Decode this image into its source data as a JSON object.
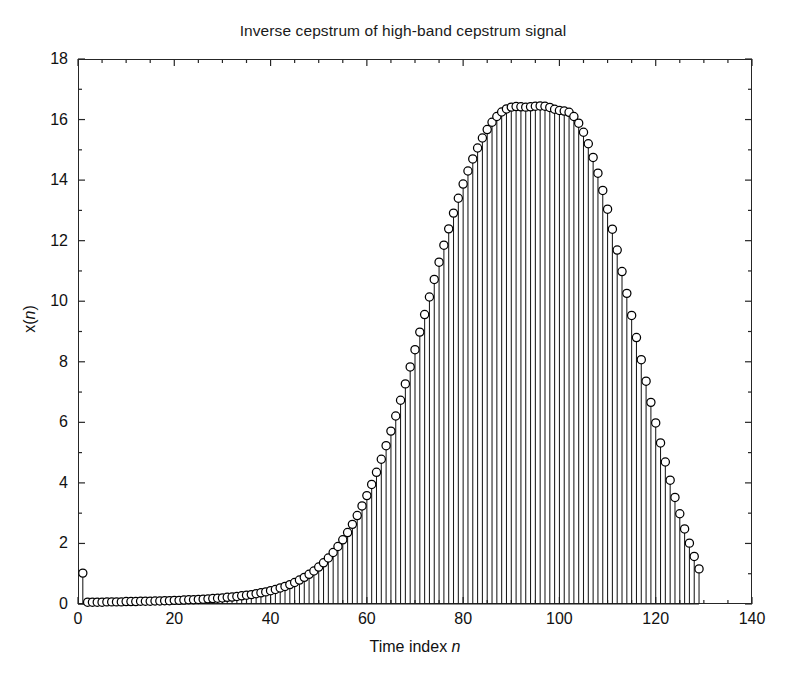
{
  "chart_data": {
    "type": "stem",
    "title": "Inverse cepstrum of high-band cepstrum signal",
    "xlabel_prefix": "Time index ",
    "xlabel_var": "n",
    "ylabel_prefix": "x(",
    "ylabel_var": "n",
    "ylabel_suffix": ")",
    "xlim": [
      0,
      140
    ],
    "ylim": [
      0,
      18
    ],
    "xticks": [
      0,
      20,
      40,
      60,
      80,
      100,
      120,
      140
    ],
    "xtick_labels": [
      "0",
      "20",
      "40",
      "60",
      "80",
      "100",
      "120",
      "140"
    ],
    "yticks": [
      0,
      2,
      4,
      6,
      8,
      10,
      12,
      14,
      16,
      18
    ],
    "ytick_labels": [
      "0",
      "2",
      "4",
      "6",
      "8",
      "10",
      "12",
      "14",
      "16",
      "18"
    ],
    "grid": false,
    "legend": null,
    "marker": "open-circle",
    "marker_color": "#000000",
    "marker_fill": "#ffffff",
    "line_color": "#1a1a1a",
    "background": "#ffffff",
    "peak_x": 100,
    "peak_y": 16.4,
    "data_end_x": 129,
    "x": [
      1,
      2,
      3,
      4,
      5,
      6,
      7,
      8,
      9,
      10,
      11,
      12,
      13,
      14,
      15,
      16,
      17,
      18,
      19,
      20,
      21,
      22,
      23,
      24,
      25,
      26,
      27,
      28,
      29,
      30,
      31,
      32,
      33,
      34,
      35,
      36,
      37,
      38,
      39,
      40,
      41,
      42,
      43,
      44,
      45,
      46,
      47,
      48,
      49,
      50,
      51,
      52,
      53,
      54,
      55,
      56,
      57,
      58,
      59,
      60,
      61,
      62,
      63,
      64,
      65,
      66,
      67,
      68,
      69,
      70,
      71,
      72,
      73,
      74,
      75,
      76,
      77,
      78,
      79,
      80,
      81,
      82,
      83,
      84,
      85,
      86,
      87,
      88,
      89,
      90,
      91,
      92,
      93,
      94,
      95,
      96,
      97,
      98,
      99,
      100,
      101,
      102,
      103,
      104,
      105,
      106,
      107,
      108,
      109,
      110,
      111,
      112,
      113,
      114,
      115,
      116,
      117,
      118,
      119,
      120,
      121,
      122,
      123,
      124,
      125,
      126,
      127,
      128,
      129
    ],
    "y": [
      1.02,
      0.06,
      0.06,
      0.06,
      0.06,
      0.07,
      0.07,
      0.07,
      0.07,
      0.08,
      0.08,
      0.08,
      0.09,
      0.09,
      0.09,
      0.1,
      0.1,
      0.11,
      0.11,
      0.12,
      0.12,
      0.13,
      0.14,
      0.14,
      0.15,
      0.16,
      0.17,
      0.18,
      0.19,
      0.2,
      0.22,
      0.23,
      0.25,
      0.27,
      0.29,
      0.31,
      0.34,
      0.37,
      0.4,
      0.44,
      0.48,
      0.53,
      0.58,
      0.64,
      0.71,
      0.79,
      0.88,
      0.98,
      1.09,
      1.22,
      1.36,
      1.52,
      1.7,
      1.9,
      2.12,
      2.36,
      2.63,
      2.92,
      3.24,
      3.58,
      3.95,
      4.35,
      4.78,
      5.23,
      5.71,
      6.21,
      6.73,
      7.27,
      7.83,
      8.4,
      8.98,
      9.56,
      10.14,
      10.72,
      11.29,
      11.85,
      12.39,
      12.91,
      13.4,
      13.87,
      14.3,
      14.7,
      15.06,
      15.39,
      15.67,
      15.91,
      16.1,
      16.25,
      16.35,
      16.41,
      16.43,
      16.42,
      16.41,
      16.42,
      16.44,
      16.45,
      16.44,
      16.4,
      16.34,
      16.3,
      16.28,
      16.24,
      16.1,
      15.88,
      15.58,
      15.2,
      14.75,
      14.23,
      13.66,
      13.04,
      12.38,
      11.69,
      10.98,
      10.26,
      9.53,
      8.8,
      8.07,
      7.36,
      6.66,
      5.98,
      5.32,
      4.69,
      4.09,
      3.52,
      2.98,
      2.48,
      2.01,
      1.57,
      1.16,
      0.32
    ]
  },
  "labels": {
    "title": "Inverse cepstrum of high-band cepstrum signal",
    "x_axis": "Time index n",
    "y_axis": "x(n)"
  }
}
